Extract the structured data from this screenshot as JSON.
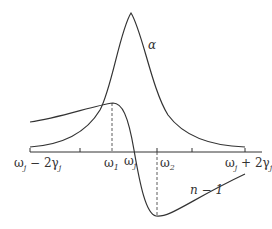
{
  "diagram": {
    "curves": [
      {
        "name": "alpha",
        "label": "α",
        "description": "absorption Lorentzian peak centered at ω_j"
      },
      {
        "name": "n-minus-1",
        "label": "n − 1",
        "description": "dispersion curve, max at ω1, min at ω2, zero at ω_j"
      }
    ],
    "axis": {
      "ticks": [
        {
          "label_main": "ω",
          "label_sub": "j",
          "label_rest": " − 2γ",
          "label_sub2": "j"
        },
        {
          "label_main": "ω",
          "label_sub": "1"
        },
        {
          "label_main": "ω",
          "label_sub": "j"
        },
        {
          "label_main": "ω",
          "label_sub": "2"
        },
        {
          "label_main": "ω",
          "label_sub": "j",
          "label_rest": " + 2γ",
          "label_sub2": "j"
        }
      ]
    },
    "labels": {
      "alpha": "α",
      "n_minus_1": "n − 1"
    },
    "colors": {
      "stroke": "#333333",
      "background": "#ffffff"
    }
  }
}
